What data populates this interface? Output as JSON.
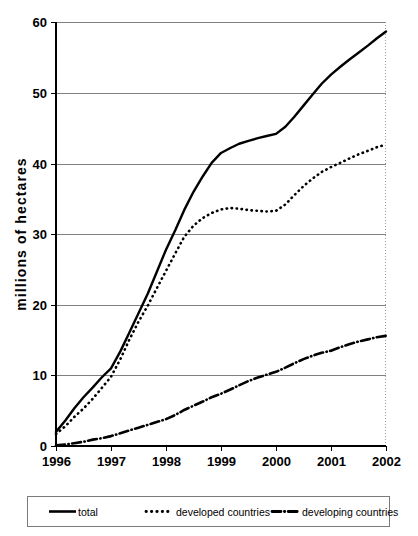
{
  "chart_data": {
    "type": "line",
    "title": "",
    "subtitle": "",
    "xlabel": "",
    "ylabel": "millions of hectares",
    "xlim": [
      1996,
      2002
    ],
    "ylim": [
      0,
      60
    ],
    "grid": true,
    "legend_position": "bottom",
    "x": [
      1996,
      1997,
      1998,
      1999,
      2000,
      2001,
      2002
    ],
    "categories": [
      "1996",
      "1997",
      "1998",
      "1999",
      "2000",
      "2001",
      "2002"
    ],
    "ytick_labels": [
      "0",
      "10",
      "20",
      "30",
      "40",
      "50",
      "60"
    ],
    "ytick_values": [
      0,
      10,
      20,
      30,
      40,
      50,
      60
    ],
    "series": [
      {
        "name": "total",
        "style": "solid",
        "values": [
          2.0,
          11.0,
          27.8,
          41.5,
          44.2,
          52.6,
          58.7
        ]
      },
      {
        "name": "developed countries",
        "style": "dotted",
        "values": [
          1.7,
          9.8,
          24.8,
          33.5,
          33.3,
          39.5,
          42.7
        ]
      },
      {
        "name": "developing countries",
        "style": "dash-dot",
        "values": [
          0.1,
          1.4,
          3.8,
          7.4,
          10.5,
          13.5,
          15.6
        ]
      }
    ],
    "series_dense": {
      "total": [
        [
          1996.0,
          2.0
        ],
        [
          1996.17,
          3.6
        ],
        [
          1996.33,
          5.3
        ],
        [
          1996.5,
          6.9
        ],
        [
          1996.67,
          8.3
        ],
        [
          1996.83,
          9.7
        ],
        [
          1997.0,
          11.0
        ],
        [
          1997.17,
          13.4
        ],
        [
          1997.33,
          16.0
        ],
        [
          1997.5,
          18.8
        ],
        [
          1997.67,
          21.6
        ],
        [
          1997.83,
          24.6
        ],
        [
          1998.0,
          27.8
        ],
        [
          1998.17,
          30.6
        ],
        [
          1998.33,
          33.4
        ],
        [
          1998.5,
          36.0
        ],
        [
          1998.67,
          38.2
        ],
        [
          1998.83,
          40.1
        ],
        [
          1999.0,
          41.5
        ],
        [
          1999.17,
          42.2
        ],
        [
          1999.33,
          42.8
        ],
        [
          1999.5,
          43.2
        ],
        [
          1999.67,
          43.6
        ],
        [
          1999.83,
          43.9
        ],
        [
          2000.0,
          44.2
        ],
        [
          2000.17,
          45.2
        ],
        [
          2000.33,
          46.6
        ],
        [
          2000.5,
          48.2
        ],
        [
          2000.67,
          49.8
        ],
        [
          2000.83,
          51.3
        ],
        [
          2001.0,
          52.6
        ],
        [
          2001.17,
          53.7
        ],
        [
          2001.33,
          54.7
        ],
        [
          2001.5,
          55.7
        ],
        [
          2001.67,
          56.7
        ],
        [
          2001.83,
          57.7
        ],
        [
          2002.0,
          58.7
        ]
      ],
      "developed": [
        [
          1996.0,
          1.7
        ],
        [
          1996.17,
          2.8
        ],
        [
          1996.33,
          4.1
        ],
        [
          1996.5,
          5.3
        ],
        [
          1996.67,
          6.7
        ],
        [
          1996.83,
          8.2
        ],
        [
          1997.0,
          9.8
        ],
        [
          1997.17,
          12.3
        ],
        [
          1997.33,
          15.0
        ],
        [
          1997.5,
          17.6
        ],
        [
          1997.67,
          19.9
        ],
        [
          1997.83,
          22.3
        ],
        [
          1998.0,
          24.8
        ],
        [
          1998.17,
          27.3
        ],
        [
          1998.33,
          29.6
        ],
        [
          1998.5,
          31.2
        ],
        [
          1998.67,
          32.3
        ],
        [
          1998.83,
          33.0
        ],
        [
          1999.0,
          33.5
        ],
        [
          1999.17,
          33.7
        ],
        [
          1999.33,
          33.6
        ],
        [
          1999.5,
          33.4
        ],
        [
          1999.67,
          33.3
        ],
        [
          1999.83,
          33.2
        ],
        [
          2000.0,
          33.3
        ],
        [
          2000.17,
          34.2
        ],
        [
          2000.33,
          35.5
        ],
        [
          2000.5,
          36.8
        ],
        [
          2000.67,
          37.9
        ],
        [
          2000.83,
          38.8
        ],
        [
          2001.0,
          39.5
        ],
        [
          2001.17,
          40.1
        ],
        [
          2001.33,
          40.7
        ],
        [
          2001.5,
          41.3
        ],
        [
          2001.67,
          41.8
        ],
        [
          2001.83,
          42.3
        ],
        [
          2002.0,
          42.7
        ]
      ],
      "developing": [
        [
          1996.0,
          0.1
        ],
        [
          1996.17,
          0.2
        ],
        [
          1996.33,
          0.4
        ],
        [
          1996.5,
          0.6
        ],
        [
          1996.67,
          0.9
        ],
        [
          1996.83,
          1.1
        ],
        [
          1997.0,
          1.4
        ],
        [
          1997.17,
          1.8
        ],
        [
          1997.33,
          2.2
        ],
        [
          1997.5,
          2.6
        ],
        [
          1997.67,
          3.0
        ],
        [
          1997.83,
          3.4
        ],
        [
          1998.0,
          3.8
        ],
        [
          1998.17,
          4.4
        ],
        [
          1998.33,
          5.1
        ],
        [
          1998.5,
          5.7
        ],
        [
          1998.67,
          6.3
        ],
        [
          1998.83,
          6.9
        ],
        [
          1999.0,
          7.4
        ],
        [
          1999.17,
          8.0
        ],
        [
          1999.33,
          8.6
        ],
        [
          1999.5,
          9.2
        ],
        [
          1999.67,
          9.7
        ],
        [
          1999.83,
          10.1
        ],
        [
          2000.0,
          10.5
        ],
        [
          2000.17,
          11.1
        ],
        [
          2000.33,
          11.7
        ],
        [
          2000.5,
          12.3
        ],
        [
          2000.67,
          12.8
        ],
        [
          2000.83,
          13.2
        ],
        [
          2001.0,
          13.5
        ],
        [
          2001.17,
          14.0
        ],
        [
          2001.33,
          14.4
        ],
        [
          2001.5,
          14.8
        ],
        [
          2001.67,
          15.1
        ],
        [
          2001.83,
          15.4
        ],
        [
          2002.0,
          15.6
        ]
      ]
    },
    "legend_entries": [
      {
        "label": "total",
        "style": "solid"
      },
      {
        "label": "developed countries",
        "style": "dotted"
      },
      {
        "label": "developing countries",
        "style": "dash-dot"
      }
    ],
    "colors": {
      "series": "#000000",
      "gridline": "#808080",
      "axis": "#000000",
      "background": "#ffffff"
    }
  }
}
